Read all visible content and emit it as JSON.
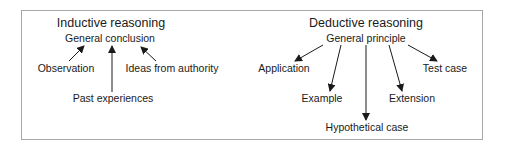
{
  "diagram": {
    "inductive": {
      "title": "Inductive reasoning",
      "center": "General conclusion",
      "sources": [
        "Observation",
        "Past experiences",
        "Ideas from authority"
      ],
      "arrow_direction": "toward-center"
    },
    "deductive": {
      "title": "Deductive reasoning",
      "center": "General principle",
      "targets": [
        "Application",
        "Example",
        "Hypothetical case",
        "Extension",
        "Test case"
      ],
      "arrow_direction": "away-from-center"
    },
    "colors": {
      "text": "#1a1a1a",
      "arrow": "#1a1a1a",
      "frame": "#a8a8a8",
      "background": "#ffffff"
    }
  }
}
